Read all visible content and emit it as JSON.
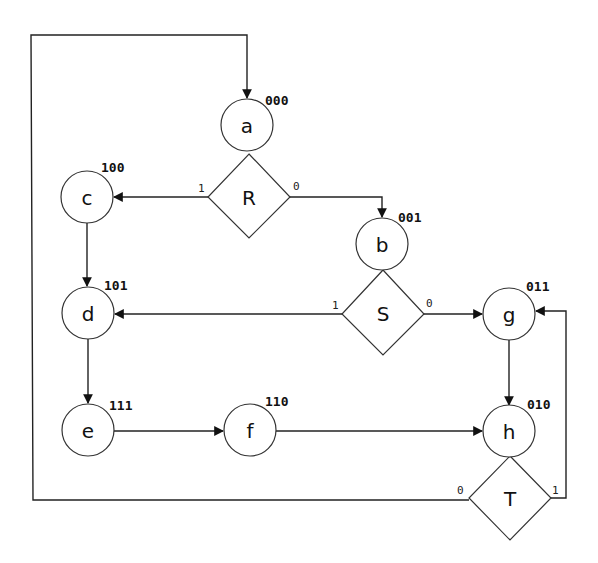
{
  "diagram": {
    "type": "ASM state chart",
    "states": [
      {
        "id": "a",
        "label": "a",
        "code": "000"
      },
      {
        "id": "b",
        "label": "b",
        "code": "001"
      },
      {
        "id": "c",
        "label": "c",
        "code": "100"
      },
      {
        "id": "d",
        "label": "d",
        "code": "101"
      },
      {
        "id": "e",
        "label": "e",
        "code": "111"
      },
      {
        "id": "f",
        "label": "f",
        "code": "110"
      },
      {
        "id": "g",
        "label": "g",
        "code": "011"
      },
      {
        "id": "h",
        "label": "h",
        "code": "010"
      }
    ],
    "decisions": [
      {
        "id": "R",
        "label": "R",
        "true_label": "1",
        "false_label": "0"
      },
      {
        "id": "S",
        "label": "S",
        "true_label": "1",
        "false_label": "0"
      },
      {
        "id": "T",
        "label": "T",
        "true_label": "1",
        "false_label": "0"
      }
    ],
    "edges": [
      {
        "from": "a",
        "to": "R"
      },
      {
        "from": "R",
        "to": "c",
        "label": "1"
      },
      {
        "from": "R",
        "to": "b",
        "label": "0"
      },
      {
        "from": "c",
        "to": "d"
      },
      {
        "from": "b",
        "to": "S"
      },
      {
        "from": "S",
        "to": "d",
        "label": "1"
      },
      {
        "from": "S",
        "to": "g",
        "label": "0"
      },
      {
        "from": "d",
        "to": "e"
      },
      {
        "from": "e",
        "to": "f"
      },
      {
        "from": "f",
        "to": "h"
      },
      {
        "from": "g",
        "to": "h"
      },
      {
        "from": "h",
        "to": "T"
      },
      {
        "from": "T",
        "to": "a",
        "label": "0"
      },
      {
        "from": "T",
        "to": "g",
        "label": "1"
      }
    ]
  }
}
